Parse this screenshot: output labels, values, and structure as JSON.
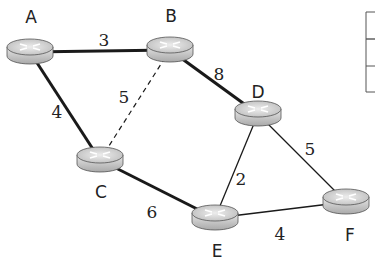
{
  "diagram": {
    "type": "network-graph",
    "nodes": [
      {
        "id": "A",
        "label": "A",
        "x": 30,
        "y": 52,
        "lx": 31,
        "ly": 23
      },
      {
        "id": "B",
        "label": "B",
        "x": 170,
        "y": 50,
        "lx": 171,
        "ly": 22
      },
      {
        "id": "C",
        "label": "C",
        "x": 100,
        "y": 160,
        "lx": 101,
        "ly": 198
      },
      {
        "id": "D",
        "label": "D",
        "x": 258,
        "y": 114,
        "lx": 258,
        "ly": 98
      },
      {
        "id": "E",
        "label": "E",
        "x": 215,
        "y": 218,
        "lx": 217,
        "ly": 257
      },
      {
        "id": "F",
        "label": "F",
        "x": 346,
        "y": 202,
        "lx": 350,
        "ly": 241
      }
    ],
    "edges": [
      {
        "from": "A",
        "to": "B",
        "weight": "3",
        "style": "bold",
        "lx": 104,
        "ly": 46
      },
      {
        "from": "A",
        "to": "C",
        "weight": "4",
        "style": "bold",
        "lx": 57,
        "ly": 118
      },
      {
        "from": "B",
        "to": "C",
        "weight": "5",
        "style": "dashed",
        "lx": 124,
        "ly": 103
      },
      {
        "from": "B",
        "to": "D",
        "weight": "8",
        "style": "bold",
        "lx": 219,
        "ly": 80
      },
      {
        "from": "C",
        "to": "E",
        "weight": "6",
        "style": "bold",
        "lx": 152,
        "ly": 218
      },
      {
        "from": "D",
        "to": "E",
        "weight": "2",
        "style": "thin",
        "lx": 241,
        "ly": 185
      },
      {
        "from": "D",
        "to": "F",
        "weight": "5",
        "style": "thin",
        "lx": 310,
        "ly": 155
      },
      {
        "from": "E",
        "to": "F",
        "weight": "4",
        "style": "thin",
        "lx": 280,
        "ly": 240
      }
    ],
    "colors": {
      "line": "#1a1a1a",
      "router_top": "#d8d8d8",
      "router_side": "#b8b8b8",
      "text": "#222222"
    }
  },
  "table_fragment": {
    "rows": 3
  }
}
